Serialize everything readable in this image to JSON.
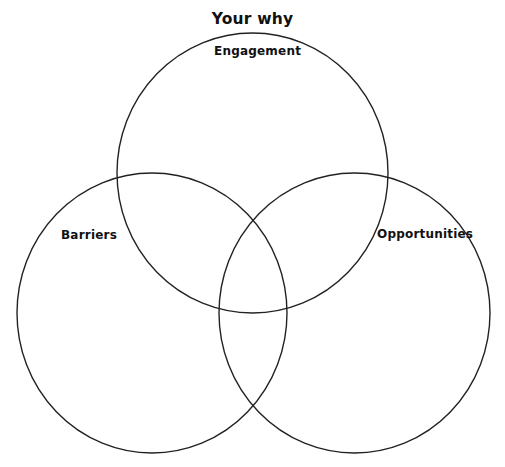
{
  "diagram": {
    "title": "Your why",
    "type": "venn",
    "stroke_color": "#222222",
    "circles": [
      {
        "id": "engagement",
        "label": "Engagement",
        "cx": 252.5,
        "cy": 173,
        "rx": 135.5,
        "ry": 140
      },
      {
        "id": "barriers",
        "label": "Barriers",
        "cx": 152,
        "cy": 313,
        "rx": 135,
        "ry": 140
      },
      {
        "id": "opportunities",
        "label": "Opportunities",
        "cx": 354.5,
        "cy": 313,
        "rx": 135.5,
        "ry": 140
      }
    ]
  }
}
